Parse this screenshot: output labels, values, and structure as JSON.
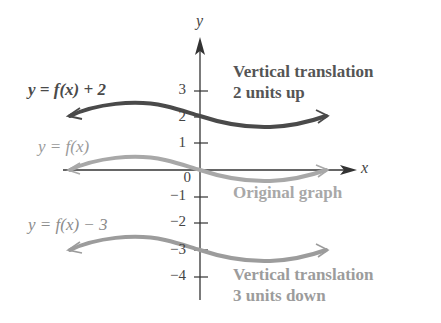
{
  "diagram": {
    "axes": {
      "x_label": "x",
      "y_label": "y",
      "y_ticks": [
        {
          "value": 3,
          "label": "3"
        },
        {
          "value": 2,
          "label": "2"
        },
        {
          "value": 1,
          "label": "1"
        },
        {
          "value": 0,
          "label": "0"
        },
        {
          "value": -1,
          "label": "−1"
        },
        {
          "value": -2,
          "label": "−2"
        },
        {
          "value": -3,
          "label": "−3"
        },
        {
          "value": -4,
          "label": "−4"
        }
      ]
    },
    "curves": {
      "shifted_up": {
        "equation": "y = f(x) + 2",
        "description_line1": "Vertical translation",
        "description_line2": "2 units up",
        "color": "#4a4a4a",
        "y_intercept": 2
      },
      "original": {
        "equation": "y = f(x)",
        "description_line1": "Original graph",
        "color": "#a8a8a8",
        "y_intercept": 0
      },
      "shifted_down": {
        "equation": "y = f(x) − 3",
        "description_line1": "Vertical translation",
        "description_line2": "3 units down",
        "color": "#9c9c9c",
        "y_intercept": -3
      }
    }
  }
}
